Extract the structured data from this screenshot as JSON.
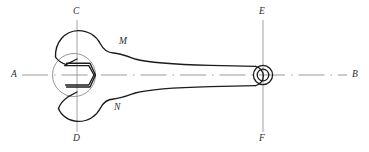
{
  "drawing": {
    "title": "Open-end wrench orthographic view",
    "background_color": "#ffffff",
    "outline_color": "#1a1a1a",
    "centerline_color": "#8c8c8c",
    "thin_line_color": "#6e6e6e",
    "label_color": "#2b2b2b"
  },
  "labels": {
    "axis_left": "A",
    "axis_right": "B",
    "head_top": "C",
    "head_bottom": "D",
    "hole_top": "E",
    "hole_bottom": "F",
    "jaw_upper": "M",
    "jaw_lower": "N"
  },
  "geometry": {
    "horizontal_axis_y": 75,
    "head_center_x": 77,
    "head_center_y": 75,
    "hole_center_x": 263,
    "hole_center_y": 75,
    "hex_across_flats": 36,
    "hole_outer_radius": 10,
    "hole_inner_radius": 6,
    "axis_a_x": 22,
    "axis_b_x": 347,
    "vertical_axis_top_y": 20,
    "vertical_axis_bottom_y": 132
  }
}
